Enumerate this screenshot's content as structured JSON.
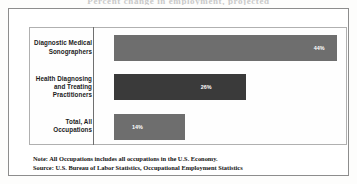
{
  "figure": {
    "clipped_title": "Percent change in employment, projected",
    "frame_color": "#8d8d8d",
    "plot_border_color": "#b0b0b0",
    "axis_color": "#6f6f6f",
    "background": "#ffffff"
  },
  "chart_data": {
    "type": "bar",
    "orientation": "horizontal",
    "title": "",
    "xlabel": "",
    "ylabel": "",
    "xlim": [
      0,
      50
    ],
    "grid": false,
    "legend": false,
    "categories": [
      "Diagnostic Medical Sonographers",
      "Health Diagnosing and Treating Practitioners",
      "Total, All Occupations"
    ],
    "values": [
      44,
      26,
      14
    ],
    "value_labels": [
      "44%",
      "26%",
      "14%"
    ],
    "bar_colors": [
      "#6e6e6e",
      "#3a3a3a",
      "#6e6e6e"
    ]
  },
  "footnotes": {
    "note": "Note: All Occupations includes all occupations in the U.S. Economy.",
    "source": "Source: U.S. Bureau of Labor Statistics, Occupational Employment Statistics"
  }
}
